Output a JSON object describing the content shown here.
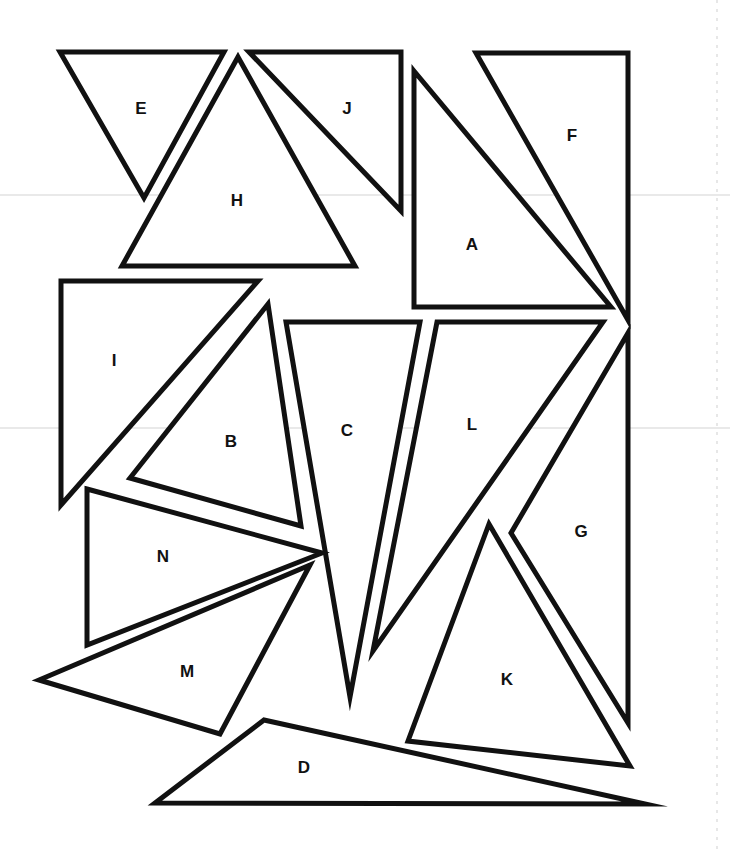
{
  "page": {
    "background": "#ffffff",
    "stroke_color": "#111111",
    "scan_line_color": "#d4d4d4"
  },
  "scan_lines": [
    {
      "y": 195
    },
    {
      "y": 428
    }
  ],
  "right_edge_dash": {
    "x": 717
  },
  "triangles": [
    {
      "id": "E",
      "label": "E",
      "points": [
        [
          60,
          52
        ],
        [
          224,
          52
        ],
        [
          144,
          198
        ]
      ],
      "label_pos": [
        141,
        110
      ]
    },
    {
      "id": "H",
      "label": "H",
      "points": [
        [
          238,
          57
        ],
        [
          355,
          266
        ],
        [
          122,
          266
        ]
      ],
      "label_pos": [
        237,
        202
      ]
    },
    {
      "id": "J",
      "label": "J",
      "points": [
        [
          249,
          52
        ],
        [
          401,
          52
        ],
        [
          401,
          211
        ]
      ],
      "label_pos": [
        347,
        110
      ]
    },
    {
      "id": "A",
      "label": "A",
      "points": [
        [
          414,
          71
        ],
        [
          611,
          307
        ],
        [
          414,
          307
        ]
      ],
      "label_pos": [
        472,
        246
      ]
    },
    {
      "id": "F",
      "label": "F",
      "points": [
        [
          476,
          53
        ],
        [
          628,
          53
        ],
        [
          628,
          320
        ]
      ],
      "label_pos": [
        572,
        137
      ]
    },
    {
      "id": "I",
      "label": "I",
      "points": [
        [
          61,
          281
        ],
        [
          258,
          281
        ],
        [
          61,
          505
        ]
      ],
      "label_pos": [
        114,
        362
      ]
    },
    {
      "id": "B",
      "label": "B",
      "points": [
        [
          268,
          304
        ],
        [
          301,
          526
        ],
        [
          130,
          478
        ]
      ],
      "label_pos": [
        231,
        443
      ]
    },
    {
      "id": "C",
      "label": "C",
      "points": [
        [
          286,
          322
        ],
        [
          420,
          322
        ],
        [
          350,
          697
        ]
      ],
      "label_pos": [
        347,
        432
      ]
    },
    {
      "id": "L",
      "label": "L",
      "points": [
        [
          437,
          322
        ],
        [
          603,
          322
        ],
        [
          373,
          651
        ]
      ],
      "label_pos": [
        472,
        426
      ]
    },
    {
      "id": "G",
      "label": "G",
      "points": [
        [
          628,
          333
        ],
        [
          628,
          723
        ],
        [
          511,
          533
        ]
      ],
      "label_pos": [
        581,
        533
      ]
    },
    {
      "id": "N",
      "label": "N",
      "points": [
        [
          87,
          489
        ],
        [
          322,
          553
        ],
        [
          87,
          645
        ]
      ],
      "label_pos": [
        163,
        558
      ]
    },
    {
      "id": "M",
      "label": "M",
      "points": [
        [
          310,
          565
        ],
        [
          220,
          734
        ],
        [
          39,
          680
        ]
      ],
      "label_pos": [
        187,
        673
      ]
    },
    {
      "id": "K",
      "label": "K",
      "points": [
        [
          489,
          524
        ],
        [
          630,
          766
        ],
        [
          408,
          741
        ]
      ],
      "label_pos": [
        507,
        681
      ]
    },
    {
      "id": "D",
      "label": "D",
      "points": [
        [
          264,
          720
        ],
        [
          645,
          804
        ],
        [
          155,
          803
        ]
      ],
      "label_pos": [
        304,
        769
      ]
    }
  ]
}
